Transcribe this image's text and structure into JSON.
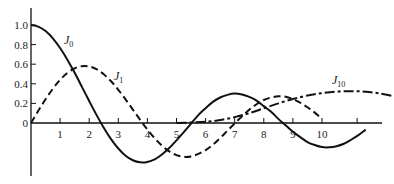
{
  "chart_data": {
    "type": "line",
    "title": "",
    "xlabel": "",
    "ylabel": "",
    "xlim": [
      0,
      12.2
    ],
    "ylim": [
      -0.5,
      1.1
    ],
    "grid": false,
    "x_ticks": [
      "1",
      "2",
      "3",
      "4",
      "5",
      "6",
      "7",
      "8",
      "9",
      "10",
      ""
    ],
    "y_ticks": [
      "0",
      "0.2",
      "0.4",
      "0.6",
      "0.8",
      "1.0"
    ],
    "series": [
      {
        "name": "J0",
        "label_main": "J",
        "label_sub": "0",
        "style": "solid",
        "x": [
          0,
          0.25,
          0.5,
          0.75,
          1,
          1.25,
          1.5,
          1.75,
          2,
          2.25,
          2.5,
          2.75,
          3,
          3.25,
          3.5,
          3.75,
          4,
          4.25,
          4.5,
          4.75,
          5,
          5.25,
          5.5,
          5.75,
          6,
          6.25,
          6.5,
          6.75,
          7,
          7.25,
          7.5,
          7.75,
          8,
          8.25,
          8.5,
          8.75,
          9,
          9.25,
          9.5,
          9.75,
          10,
          10.25,
          10.5,
          10.75,
          11,
          11.25,
          11.5
        ],
        "values": [
          1,
          0.984,
          0.938,
          0.864,
          0.765,
          0.646,
          0.512,
          0.369,
          0.224,
          0.083,
          -0.048,
          -0.164,
          -0.26,
          -0.334,
          -0.38,
          -0.401,
          -0.397,
          -0.371,
          -0.321,
          -0.256,
          -0.178,
          -0.093,
          -0.007,
          0.081,
          0.151,
          0.215,
          0.26,
          0.287,
          0.3,
          0.29,
          0.266,
          0.229,
          0.172,
          0.115,
          0.042,
          -0.023,
          -0.09,
          -0.144,
          -0.194,
          -0.225,
          -0.246,
          -0.248,
          -0.237,
          -0.212,
          -0.171,
          -0.124,
          -0.068
        ]
      },
      {
        "name": "J1",
        "label_main": "J",
        "label_sub": "1",
        "style": "dashed",
        "x": [
          0,
          0.25,
          0.5,
          0.75,
          1,
          1.25,
          1.5,
          1.75,
          2,
          2.25,
          2.5,
          2.75,
          3,
          3.25,
          3.5,
          3.75,
          4,
          4.25,
          4.5,
          4.75,
          5,
          5.25,
          5.5,
          5.75,
          6,
          6.25,
          6.5,
          6.75,
          7,
          7.25,
          7.5,
          7.75,
          8,
          8.25,
          8.5,
          8.75,
          9,
          9.25,
          9.5,
          9.75,
          10
        ],
        "values": [
          0,
          0.124,
          0.242,
          0.349,
          0.44,
          0.511,
          0.558,
          0.58,
          0.577,
          0.549,
          0.497,
          0.426,
          0.339,
          0.241,
          0.137,
          0.033,
          -0.066,
          -0.155,
          -0.231,
          -0.29,
          -0.328,
          -0.345,
          -0.341,
          -0.315,
          -0.277,
          -0.221,
          -0.154,
          -0.079,
          -0.005,
          0.068,
          0.135,
          0.191,
          0.235,
          0.26,
          0.273,
          0.268,
          0.245,
          0.207,
          0.161,
          0.106,
          0.043
        ]
      },
      {
        "name": "J10",
        "label_main": "J",
        "label_sub": "10",
        "style": "dash-dot",
        "x": [
          5,
          5.5,
          6,
          6.5,
          7,
          7.5,
          8,
          8.5,
          9,
          9.5,
          10,
          10.5,
          11,
          11.5,
          12,
          12.5
        ],
        "values": [
          0.0,
          0.005,
          0.012,
          0.03,
          0.06,
          0.1,
          0.15,
          0.2,
          0.245,
          0.28,
          0.305,
          0.32,
          0.325,
          0.32,
          0.3,
          0.27
        ]
      }
    ]
  }
}
